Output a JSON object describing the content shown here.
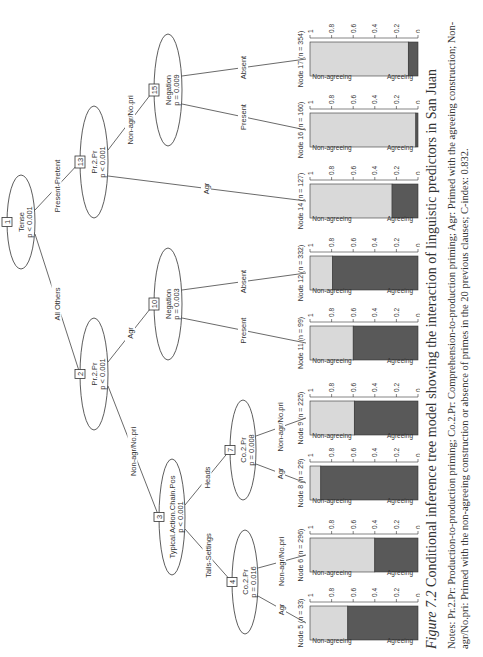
{
  "figure": {
    "label": "Figure 7.2",
    "title": "Conditional inference tree model showing the interaction of linguistic predictors in San Juan",
    "notes": "Notes: Pr.2.Pr: Production-to-production priming; Co.2.Pr: Comprehension-to-production priming; Agr: Primed with the agreeing construction; Non-agr/No.pri: Primed with the non-agreeing construction or absence of primes in the 20 previous clauses; C-index: 0.832."
  },
  "tree": {
    "inner_nodes": [
      {
        "id": "1",
        "variable": "Tense",
        "p": "p < 0.001"
      },
      {
        "id": "2",
        "variable": "Pr.2.Pr",
        "p": "p < 0.001"
      },
      {
        "id": "3",
        "variable": "Typical.Action.Chain.Pos",
        "p": "p < 0.001"
      },
      {
        "id": "4",
        "variable": "Co.2.Pr",
        "p": "p = 0.016"
      },
      {
        "id": "7",
        "variable": "Co.2.Pr",
        "p": "p = 0.008"
      },
      {
        "id": "10",
        "variable": "Negation",
        "p": "p = 0.003"
      },
      {
        "id": "13",
        "variable": "Pr.2.Pr",
        "p": "p < 0.001"
      },
      {
        "id": "15",
        "variable": "Negation",
        "p": "p = 0.009"
      }
    ],
    "edge_labels": {
      "e1_2": "All Others",
      "e1_13": "Present-Pretent",
      "e2_3": "Non-agr/No.pri",
      "e2_10": "Agr",
      "e3_4": "Tails-Settings",
      "e3_7": "Heads",
      "e4_5": "Agr",
      "e4_6": "Non-agr/No.pri",
      "e7_8": "Agr",
      "e7_9": "Non-agr/No.pri",
      "e10_11": "Present",
      "e10_12": "Absent",
      "e13_14": "Agr",
      "e13_15": "Non-agr/No.pri",
      "e15_16": "Present",
      "e15_17": "Absent"
    }
  },
  "chart_data": {
    "type": "bar",
    "categories": [
      "Node 5 (n = 33)",
      "Node 6 (n = 296)",
      "Node 8 (n = 29)",
      "Node 9 (n = 225)",
      "Node 11 (n = 99)",
      "Node 12 (n = 332)",
      "Node 14 (n = 127)",
      "Node 16 (n = 160)",
      "Node 17 (n = 354)"
    ],
    "series": [
      {
        "name": "Agreeing",
        "color": "#595959",
        "values": [
          0.65,
          0.4,
          0.9,
          0.59,
          0.6,
          0.79,
          0.24,
          0.02,
          0.09
        ]
      },
      {
        "name": "Non-agreeing",
        "color": "#d9d9d9",
        "values": [
          0.35,
          0.6,
          0.1,
          0.41,
          0.4,
          0.21,
          0.76,
          0.98,
          0.91
        ]
      }
    ],
    "yticks": [
      "0",
      "0.2",
      "0.4",
      "0.6",
      "0.8",
      "1"
    ],
    "ylim": [
      0,
      1
    ],
    "ylabel_top": "Non-agreeing",
    "ylabel_bottom": "Agreeing"
  }
}
